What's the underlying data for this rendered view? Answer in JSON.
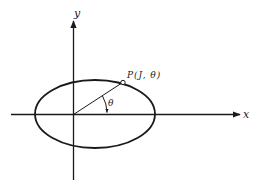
{
  "diagram": {
    "type": "polar-coordinates-ellipse",
    "axes": {
      "x_label": "x",
      "y_label": "y"
    },
    "point": {
      "label": "P(J, θ)"
    },
    "angle": {
      "label": "θ"
    },
    "colors": {
      "ink": "#1a1a1a",
      "background": "#ffffff"
    }
  }
}
